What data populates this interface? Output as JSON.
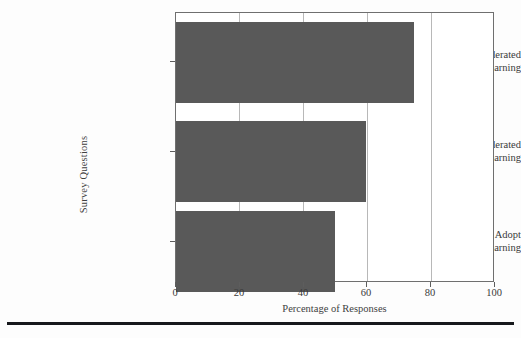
{
  "chart_data": {
    "type": "bar",
    "orientation": "horizontal",
    "title": "",
    "xlabel": "Percentage of Responses",
    "ylabel": "Survey Questions",
    "categories": [
      "Awareness of Federated Learning",
      "Acceptance of Federated Learning",
      "Willingness to Adopt Federated Learning"
    ],
    "category_lines": [
      [
        "Awareness of Federated",
        "Learning"
      ],
      [
        "Acceptance of Federated",
        "Learning"
      ],
      [
        "Willingness to Adopt",
        "Federated Learning"
      ]
    ],
    "values": [
      75,
      60,
      50
    ],
    "xlim": [
      0,
      100
    ],
    "xticks": [
      0,
      20,
      40,
      60,
      80,
      100
    ],
    "xtick_labels": [
      "0",
      "20",
      "40",
      "60",
      "80",
      "100"
    ],
    "grid": "vertical",
    "legend": "none",
    "bar_color": "#595959",
    "axis_color": "#6f6f6f",
    "grid_color": "#b8b8b8",
    "background_color": "#ffffff"
  }
}
